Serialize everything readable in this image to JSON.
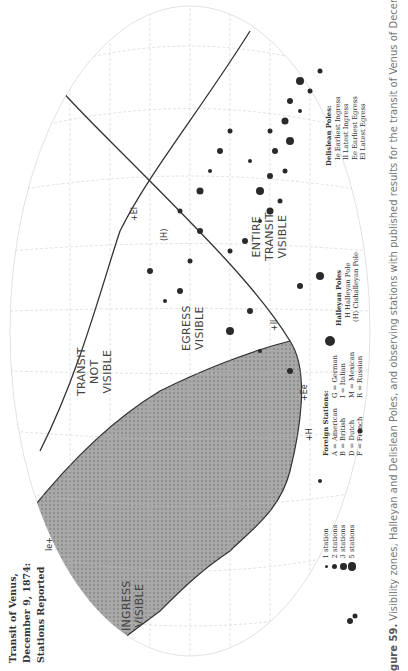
{
  "title": {
    "line1": "Transit of Venus,",
    "line2": "December 9, 1874:",
    "line3": "Stations Reported"
  },
  "map": {
    "zones": {
      "transit_not_visible": [
        "TRANSIT",
        "NOT",
        "VISIBLE"
      ],
      "ingress_visible": [
        "INGRESS",
        "VISIBLE"
      ],
      "egress_visible": [
        "EGRESS",
        "VISIBLE"
      ],
      "entire_transit_visible": [
        "ENTIRE",
        "TRANSIT",
        "VISIBLE"
      ]
    },
    "poles": {
      "ie": "Ie+",
      "ee": "+Ee",
      "il": "+Il",
      "el": "+El",
      "h": "+H",
      "h_paren": "(H)"
    },
    "colors": {
      "shade": "#9a9a9a",
      "boundary": "#333333",
      "grid": "#bbbbbb",
      "station": "#2a2a2a"
    }
  },
  "legend": {
    "sizes": [
      {
        "label": "1 station",
        "size": 3
      },
      {
        "label": "2 stations",
        "size": 5
      },
      {
        "label": "3 stations",
        "size": 6.5
      },
      {
        "label": "5 stations",
        "size": 8.5
      }
    ],
    "foreign": {
      "header": "Foreign Stations:",
      "col1": [
        "A = American",
        "B = British",
        "D = Dutch",
        "F = French"
      ],
      "col2": [
        "G = German",
        "I = Italian",
        "M = Mexican",
        "R = Russian"
      ]
    },
    "halleyan": {
      "header": "Halleyan Poles",
      "items": [
        "H   Halleyan Pole",
        "(H) Cishalleyan Pole"
      ]
    },
    "delislean": {
      "header": "Delislean Poles:",
      "items": [
        "Ie  Earliest Ingress",
        "Il   Latest Ingress",
        "Ee  Earliest Egress",
        "El   Latest Egress"
      ]
    }
  },
  "caption": {
    "fig": "gure 59.",
    "text": " Visibility zones, Halleyan and Delislean Poles, and observing stations with published results for the transit of Venus of December 9,"
  }
}
